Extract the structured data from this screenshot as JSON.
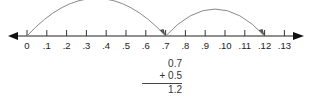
{
  "number_line": {
    "labels": [
      "0",
      ".1",
      ".2",
      ".3",
      ".4",
      ".5",
      ".6",
      ".7",
      ".8",
      ".9",
      ".10",
      ".11",
      ".12",
      ".13"
    ],
    "jumps": [
      {
        "from_index": 0,
        "to_index": 7
      },
      {
        "from_index": 7,
        "to_index": 12
      }
    ],
    "line_color": "#222222",
    "arc_color": "#888888"
  },
  "calculation": {
    "addend1": "0.7",
    "addend2": "+ 0.5",
    "sum": "1.2"
  }
}
